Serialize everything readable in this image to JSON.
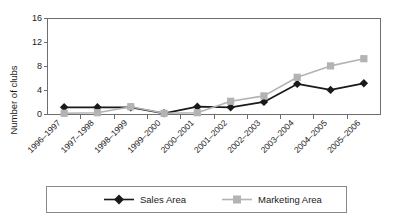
{
  "chart_data": {
    "type": "line",
    "title": "",
    "xlabel": "",
    "ylabel": "Number of clubs",
    "ylim": [
      0,
      16
    ],
    "yticks": [
      0,
      4,
      8,
      12,
      16
    ],
    "grid": false,
    "legend_position": "bottom",
    "categories": [
      "1996–1997",
      "1997–1998",
      "1998–1999",
      "1999–2000",
      "2000–2001",
      "2001–2002",
      "2002–2003",
      "2003–2004",
      "2004–2005",
      "2005–2006"
    ],
    "series": [
      {
        "name": "Sales Area",
        "color": "#1a1a1a",
        "marker": "diamond",
        "values": [
          1.2,
          1.2,
          1.2,
          0.2,
          1.3,
          1.2,
          2.1,
          5.1,
          4.1,
          5.2
        ]
      },
      {
        "name": "Marketing Area",
        "color": "#b3b3b3",
        "marker": "square",
        "values": [
          0.2,
          0.3,
          1.3,
          0.2,
          0.3,
          2.2,
          3.1,
          6.2,
          8.1,
          9.3
        ]
      }
    ]
  },
  "axes": {
    "y_title": "Number of clubs",
    "y_tick_labels": [
      "16",
      "12",
      "8",
      "4",
      "0"
    ]
  },
  "legend": {
    "entries": [
      {
        "label": "Sales Area",
        "color": "#1a1a1a",
        "marker": "diamond"
      },
      {
        "label": "Marketing Area",
        "color": "#b3b3b3",
        "marker": "square"
      }
    ]
  },
  "colors": {
    "sales": "#1a1a1a",
    "marketing": "#b3b3b3",
    "axis": "#6e6e6e",
    "legend_border": "#8a8a8a",
    "background": "#ffffff"
  }
}
